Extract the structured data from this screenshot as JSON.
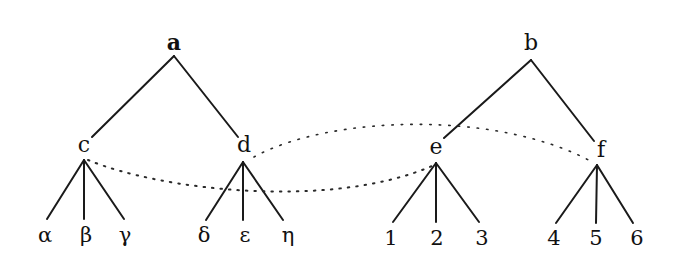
{
  "diagram": {
    "type": "tree-correspondence",
    "trees": [
      {
        "root": {
          "id": "a",
          "label": "a",
          "x": 174,
          "y": 50,
          "apex_y": 56
        },
        "children": [
          {
            "id": "c",
            "label": "c",
            "x": 84,
            "y": 152,
            "line_end": [
              92,
              137
            ],
            "apex": [
              84,
              160
            ],
            "leaves": [
              {
                "label": "α",
                "x": 45,
                "top": [
                  47,
                  219
                ]
              },
              {
                "label": "β",
                "x": 86,
                "top": [
                  84,
                  219
                ]
              },
              {
                "label": "γ",
                "x": 125,
                "top": [
                  124,
                  219
                ]
              }
            ]
          },
          {
            "id": "d",
            "label": "d",
            "x": 244,
            "y": 152,
            "line_end": [
              238,
              137
            ],
            "apex": [
              243,
              162
            ],
            "leaves": [
              {
                "label": "δ",
                "x": 204,
                "top": [
                  206,
                  220
                ]
              },
              {
                "label": "ε",
                "x": 245,
                "top": [
                  243,
                  220
                ]
              },
              {
                "label": "η",
                "x": 288,
                "top": [
                  283,
                  220
                ]
              }
            ]
          }
        ]
      },
      {
        "root": {
          "id": "b",
          "label": "b",
          "x": 531,
          "y": 50,
          "apex_y": 60
        },
        "children": [
          {
            "id": "e",
            "label": "e",
            "x": 436,
            "y": 154,
            "line_end": [
              444,
              138
            ],
            "apex": [
              436,
              163
            ],
            "leaves": [
              {
                "label": "1",
                "x": 391,
                "top": [
                  393,
                  222
                ]
              },
              {
                "label": "2",
                "x": 437,
                "top": [
                  436,
                  222
                ]
              },
              {
                "label": "3",
                "x": 482,
                "top": [
                  479,
                  222
                ]
              }
            ]
          },
          {
            "id": "f",
            "label": "f",
            "x": 601,
            "y": 157,
            "line_end": [
              594,
              141
            ],
            "apex": [
              597,
              165
            ],
            "leaves": [
              {
                "label": "4",
                "x": 554,
                "top": [
                  556,
                  223
                ]
              },
              {
                "label": "5",
                "x": 596,
                "top": [
                  596,
                  223
                ]
              },
              {
                "label": "6",
                "x": 637,
                "top": [
                  633,
                  223
                ]
              }
            ]
          }
        ]
      }
    ],
    "correspondences": [
      {
        "from": "c",
        "to": "e",
        "style": "dotted",
        "path": "M 88 160 C 160 190, 330 210, 432 166"
      },
      {
        "from": "d",
        "to": "f",
        "style": "dotted",
        "path": "M 254 157 C 330 115, 500 110, 594 163"
      }
    ]
  }
}
